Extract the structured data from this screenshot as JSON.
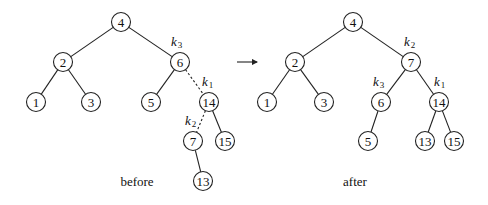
{
  "diagram": {
    "type": "tree-rotation",
    "arrow": {
      "x1": 237,
      "y1": 62,
      "x2": 257,
      "y2": 62
    },
    "trees": [
      {
        "caption": "before",
        "caption_pos": [
          137,
          186
        ],
        "nodes": [
          {
            "id": "4",
            "label": "4",
            "x": 121,
            "y": 22
          },
          {
            "id": "2",
            "label": "2",
            "x": 63,
            "y": 62
          },
          {
            "id": "6",
            "label": "6",
            "x": 180,
            "y": 62
          },
          {
            "id": "1",
            "label": "1",
            "x": 36,
            "y": 102
          },
          {
            "id": "3",
            "label": "3",
            "x": 91,
            "y": 102
          },
          {
            "id": "5",
            "label": "5",
            "x": 151,
            "y": 102
          },
          {
            "id": "14",
            "label": "14",
            "x": 209,
            "y": 102
          },
          {
            "id": "7",
            "label": "7",
            "x": 193,
            "y": 141
          },
          {
            "id": "15",
            "label": "15",
            "x": 225,
            "y": 141
          },
          {
            "id": "13",
            "label": "13",
            "x": 203,
            "y": 181
          }
        ],
        "edges": [
          {
            "from": "4",
            "to": "2",
            "dashed": false
          },
          {
            "from": "4",
            "to": "6",
            "dashed": false
          },
          {
            "from": "2",
            "to": "1",
            "dashed": false
          },
          {
            "from": "2",
            "to": "3",
            "dashed": false
          },
          {
            "from": "6",
            "to": "5",
            "dashed": false
          },
          {
            "from": "6",
            "to": "14",
            "dashed": true
          },
          {
            "from": "14",
            "to": "7",
            "dashed": true
          },
          {
            "from": "14",
            "to": "15",
            "dashed": false
          },
          {
            "from": "7",
            "to": "13",
            "dashed": false
          }
        ],
        "k_labels": [
          {
            "base": "k",
            "sub": "3",
            "x": 171,
            "y": 46
          },
          {
            "base": "k",
            "sub": "1",
            "x": 202,
            "y": 86
          },
          {
            "base": "k",
            "sub": "2",
            "x": 185,
            "y": 125
          }
        ]
      },
      {
        "caption": "after",
        "caption_pos": [
          355,
          186
        ],
        "nodes": [
          {
            "id": "4",
            "label": "4",
            "x": 353,
            "y": 22
          },
          {
            "id": "2",
            "label": "2",
            "x": 295,
            "y": 62
          },
          {
            "id": "7",
            "label": "7",
            "x": 411,
            "y": 62
          },
          {
            "id": "1",
            "label": "1",
            "x": 267,
            "y": 102
          },
          {
            "id": "3",
            "label": "3",
            "x": 324,
            "y": 102
          },
          {
            "id": "6",
            "label": "6",
            "x": 381,
            "y": 102
          },
          {
            "id": "14",
            "label": "14",
            "x": 439,
            "y": 102
          },
          {
            "id": "5",
            "label": "5",
            "x": 368,
            "y": 141
          },
          {
            "id": "13",
            "label": "13",
            "x": 425,
            "y": 141
          },
          {
            "id": "15",
            "label": "15",
            "x": 454,
            "y": 141
          }
        ],
        "edges": [
          {
            "from": "4",
            "to": "2",
            "dashed": false
          },
          {
            "from": "4",
            "to": "7",
            "dashed": false
          },
          {
            "from": "2",
            "to": "1",
            "dashed": false
          },
          {
            "from": "2",
            "to": "3",
            "dashed": false
          },
          {
            "from": "7",
            "to": "6",
            "dashed": false
          },
          {
            "from": "7",
            "to": "14",
            "dashed": false
          },
          {
            "from": "6",
            "to": "5",
            "dashed": false
          },
          {
            "from": "14",
            "to": "13",
            "dashed": false
          },
          {
            "from": "14",
            "to": "15",
            "dashed": false
          }
        ],
        "k_labels": [
          {
            "base": "k",
            "sub": "2",
            "x": 404,
            "y": 46
          },
          {
            "base": "k",
            "sub": "3",
            "x": 373,
            "y": 86
          },
          {
            "base": "k",
            "sub": "1",
            "x": 434,
            "y": 86
          }
        ]
      }
    ]
  }
}
